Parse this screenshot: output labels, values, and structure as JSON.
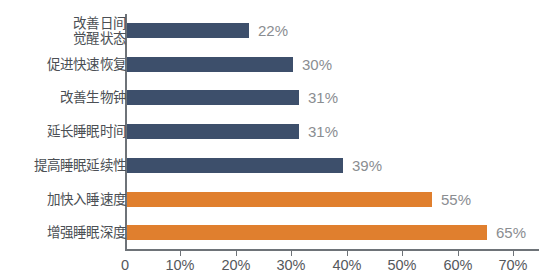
{
  "chart_data": {
    "type": "bar",
    "orientation": "horizontal",
    "title": "",
    "subtitle": "",
    "xlabel": "",
    "ylabel": "",
    "xlim": [
      0,
      70
    ],
    "grid": false,
    "legend": null,
    "value_suffix": "%",
    "categories": [
      "改善日间觉醒状态",
      "促进快速恢复",
      "改善生物钟",
      "延长睡眠时间",
      "提高睡眠延续性",
      "加快入睡速度",
      "增强睡眠深度"
    ],
    "values": [
      22,
      30,
      31,
      31,
      39,
      55,
      65
    ],
    "value_labels": [
      "22%",
      "30%",
      "31%",
      "31%",
      "39%",
      "55%",
      "65%"
    ],
    "bar_colors": [
      "#3d4f6b",
      "#3d4f6b",
      "#3d4f6b",
      "#3d4f6b",
      "#3d4f6b",
      "#e07f2e",
      "#e07f2e"
    ],
    "xticks": [
      0,
      10,
      20,
      30,
      40,
      50,
      60,
      70
    ],
    "xtick_labels": [
      "0",
      "10%",
      "20%",
      "30%",
      "40%",
      "50%",
      "60%",
      "70%"
    ],
    "colors": {
      "blue": "#3d4f6b",
      "orange": "#e07f2e",
      "axis": "#6e7378",
      "value_text": "#8a8d91",
      "category_text": "#4b4f54",
      "tick_text": "#55585c",
      "background": "#ffffff"
    }
  },
  "rows": [
    {
      "label_line1": "改善日间",
      "label_line2": "觉醒状态",
      "value_label": "22%"
    },
    {
      "label_line1": "促进快速恢复",
      "label_line2": "",
      "value_label": "30%"
    },
    {
      "label_line1": "改善生物钟",
      "label_line2": "",
      "value_label": "31%"
    },
    {
      "label_line1": "延长睡眠时间",
      "label_line2": "",
      "value_label": "31%"
    },
    {
      "label_line1": "提高睡眠延续性",
      "label_line2": "",
      "value_label": "39%"
    },
    {
      "label_line1": "加快入睡速度",
      "label_line2": "",
      "value_label": "55%"
    },
    {
      "label_line1": "增强睡眠深度",
      "label_line2": "",
      "value_label": "65%"
    }
  ],
  "xaxis": {
    "labels": [
      "0",
      "10%",
      "20%",
      "30%",
      "40%",
      "50%",
      "60%",
      "70%"
    ]
  }
}
